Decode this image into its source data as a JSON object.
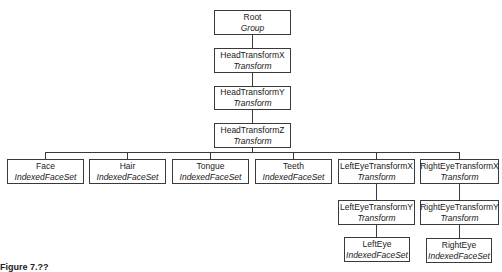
{
  "diagram": {
    "nodes": {
      "root": {
        "name": "Root",
        "type": "Group"
      },
      "head_x": {
        "name": "HeadTransformX",
        "type": "Transform"
      },
      "head_y": {
        "name": "HeadTransformY",
        "type": "Transform"
      },
      "head_z": {
        "name": "HeadTransformZ",
        "type": "Transform"
      },
      "face": {
        "name": "Face",
        "type": "IndexedFaceSet"
      },
      "hair": {
        "name": "Hair",
        "type": "IndexedFaceSet"
      },
      "tongue": {
        "name": "Tongue",
        "type": "IndexedFaceSet"
      },
      "teeth": {
        "name": "Teeth",
        "type": "IndexedFaceSet"
      },
      "lefteye_x": {
        "name": "LeftEyeTransformX",
        "type": "Transform"
      },
      "righteye_x": {
        "name": "RightEyeTransformX",
        "type": "Transform"
      },
      "lefteye_y": {
        "name": "LeftEyeTransformY",
        "type": "Transform"
      },
      "righteye_y": {
        "name": "RightEyeTransformY",
        "type": "Transform"
      },
      "lefteye": {
        "name": "LeftEye",
        "type": "IndexedFaceSet"
      },
      "righteye": {
        "name": "RightEye",
        "type": "IndexedFaceSet"
      }
    },
    "edges": [
      [
        "root",
        "head_x"
      ],
      [
        "head_x",
        "head_y"
      ],
      [
        "head_y",
        "head_z"
      ],
      [
        "head_z",
        "face"
      ],
      [
        "head_z",
        "hair"
      ],
      [
        "head_z",
        "tongue"
      ],
      [
        "head_z",
        "teeth"
      ],
      [
        "head_z",
        "lefteye_x"
      ],
      [
        "head_z",
        "righteye_x"
      ],
      [
        "lefteye_x",
        "lefteye_y"
      ],
      [
        "lefteye_y",
        "lefteye"
      ],
      [
        "righteye_x",
        "righteye_y"
      ],
      [
        "righteye_y",
        "righteye"
      ]
    ],
    "caption": "Figure 7.??"
  }
}
